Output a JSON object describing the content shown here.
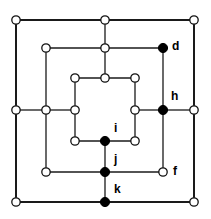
{
  "figure": {
    "background_color": "#ffffff",
    "edge_color": "#1a1a1a",
    "node_open_fill": "#ffffff",
    "node_open_stroke": "#111111",
    "node_filled_fill": "#000000",
    "label_color": "#000000",
    "width": 211,
    "height": 219
  },
  "chart_data": {
    "type": "diagram",
    "node_radius_open": 4.2,
    "node_radius_filled": 4.6,
    "rings": [
      {
        "name": "outer-square",
        "left": 16,
        "right": 194,
        "top": 20,
        "bottom": 202,
        "stroke_width": 2.0
      },
      {
        "name": "middle-square",
        "left": 46,
        "right": 163,
        "top": 48,
        "bottom": 172,
        "stroke_width": 1.3
      },
      {
        "name": "inner-square",
        "left": 75,
        "right": 135,
        "top": 78,
        "bottom": 141,
        "stroke_width": 1.3
      }
    ],
    "nodes": [
      {
        "id": "o-tl",
        "x": 16,
        "y": 20,
        "style": "open",
        "label": ""
      },
      {
        "id": "o-tm",
        "x": 105,
        "y": 20,
        "style": "open",
        "label": ""
      },
      {
        "id": "o-tr",
        "x": 194,
        "y": 20,
        "style": "open",
        "label": ""
      },
      {
        "id": "o-lm",
        "x": 16,
        "y": 110,
        "style": "open",
        "label": ""
      },
      {
        "id": "o-rm",
        "x": 194,
        "y": 110,
        "style": "open",
        "label": ""
      },
      {
        "id": "o-bl",
        "x": 16,
        "y": 202,
        "style": "open",
        "label": ""
      },
      {
        "id": "k",
        "x": 105,
        "y": 202,
        "style": "filled",
        "label": "k",
        "label_dx": 9,
        "label_dy": -12
      },
      {
        "id": "o-br",
        "x": 194,
        "y": 202,
        "style": "open",
        "label": ""
      },
      {
        "id": "m-tl",
        "x": 46,
        "y": 48,
        "style": "open",
        "label": ""
      },
      {
        "id": "m-tm",
        "x": 105,
        "y": 48,
        "style": "open",
        "label": ""
      },
      {
        "id": "d",
        "x": 163,
        "y": 48,
        "style": "filled",
        "label": "d",
        "label_dx": 9,
        "label_dy": -1
      },
      {
        "id": "m-lm",
        "x": 46,
        "y": 110,
        "style": "open",
        "label": ""
      },
      {
        "id": "h",
        "x": 163,
        "y": 110,
        "style": "filled",
        "label": "h",
        "label_dx": 8,
        "label_dy": -13
      },
      {
        "id": "m-bl",
        "x": 46,
        "y": 172,
        "style": "open",
        "label": ""
      },
      {
        "id": "j",
        "x": 105,
        "y": 172,
        "style": "filled",
        "label": "j",
        "label_dx": 9,
        "label_dy": -12
      },
      {
        "id": "f",
        "x": 163,
        "y": 172,
        "style": "open",
        "label": "f",
        "label_dx": 10,
        "label_dy": 0
      },
      {
        "id": "i-tl",
        "x": 75,
        "y": 78,
        "style": "open",
        "label": ""
      },
      {
        "id": "i-tm",
        "x": 105,
        "y": 78,
        "style": "open",
        "label": ""
      },
      {
        "id": "i-tr",
        "x": 135,
        "y": 78,
        "style": "open",
        "label": ""
      },
      {
        "id": "i-lm",
        "x": 75,
        "y": 110,
        "style": "open",
        "label": ""
      },
      {
        "id": "i-rm",
        "x": 135,
        "y": 110,
        "style": "open",
        "label": ""
      },
      {
        "id": "i-bl",
        "x": 75,
        "y": 141,
        "style": "open",
        "label": ""
      },
      {
        "id": "i",
        "x": 105,
        "y": 141,
        "style": "filled",
        "label": "i",
        "label_dx": 9,
        "label_dy": -12
      },
      {
        "id": "i-br",
        "x": 135,
        "y": 141,
        "style": "open",
        "label": ""
      }
    ],
    "edges": [
      {
        "x1": 16,
        "y1": 20,
        "x2": 194,
        "y2": 20,
        "w": 2.0
      },
      {
        "x1": 16,
        "y1": 202,
        "x2": 194,
        "y2": 202,
        "w": 2.0
      },
      {
        "x1": 16,
        "y1": 20,
        "x2": 16,
        "y2": 202,
        "w": 2.0
      },
      {
        "x1": 194,
        "y1": 20,
        "x2": 194,
        "y2": 202,
        "w": 2.0
      },
      {
        "x1": 46,
        "y1": 48,
        "x2": 163,
        "y2": 48,
        "w": 1.3
      },
      {
        "x1": 46,
        "y1": 172,
        "x2": 163,
        "y2": 172,
        "w": 1.3
      },
      {
        "x1": 46,
        "y1": 48,
        "x2": 46,
        "y2": 172,
        "w": 1.3
      },
      {
        "x1": 163,
        "y1": 48,
        "x2": 163,
        "y2": 172,
        "w": 1.3
      },
      {
        "x1": 75,
        "y1": 78,
        "x2": 135,
        "y2": 78,
        "w": 1.3
      },
      {
        "x1": 75,
        "y1": 141,
        "x2": 135,
        "y2": 141,
        "w": 1.3
      },
      {
        "x1": 75,
        "y1": 78,
        "x2": 75,
        "y2": 141,
        "w": 1.3
      },
      {
        "x1": 135,
        "y1": 78,
        "x2": 135,
        "y2": 141,
        "w": 1.3
      },
      {
        "x1": 105,
        "y1": 20,
        "x2": 105,
        "y2": 48,
        "w": 1.3
      },
      {
        "x1": 105,
        "y1": 48,
        "x2": 105,
        "y2": 78,
        "w": 1.3
      },
      {
        "x1": 16,
        "y1": 110,
        "x2": 46,
        "y2": 110,
        "w": 1.3
      },
      {
        "x1": 46,
        "y1": 110,
        "x2": 75,
        "y2": 110,
        "w": 1.3
      },
      {
        "x1": 163,
        "y1": 110,
        "x2": 194,
        "y2": 110,
        "w": 1.3
      },
      {
        "x1": 135,
        "y1": 110,
        "x2": 163,
        "y2": 110,
        "w": 1.3
      },
      {
        "x1": 105,
        "y1": 141,
        "x2": 105,
        "y2": 172,
        "w": 1.3
      },
      {
        "x1": 105,
        "y1": 172,
        "x2": 105,
        "y2": 202,
        "w": 1.3
      }
    ],
    "labels": [
      {
        "text": "d",
        "x": 172,
        "y": 47
      },
      {
        "text": "h",
        "x": 171,
        "y": 97
      },
      {
        "text": "i",
        "x": 114,
        "y": 129
      },
      {
        "text": "j",
        "x": 114,
        "y": 160
      },
      {
        "text": "f",
        "x": 173,
        "y": 172
      },
      {
        "text": "k",
        "x": 114,
        "y": 190
      }
    ]
  }
}
